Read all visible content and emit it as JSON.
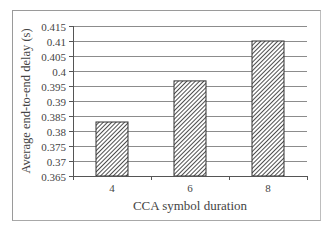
{
  "chart_data": {
    "type": "bar",
    "title": "",
    "xlabel": "CCA symbol duration",
    "ylabel": "Average end-to-end delay (s)",
    "categories": [
      "4",
      "6",
      "8"
    ],
    "values": [
      0.383,
      0.3967,
      0.41
    ],
    "ylim": [
      0.365,
      0.415
    ],
    "yticks": [
      "0.415",
      "0.41",
      "0.405",
      "0.4",
      "0.395",
      "0.39",
      "0.385",
      "0.38",
      "0.375",
      "0.37",
      "0.365"
    ],
    "grid": true,
    "legend": null,
    "bar_fill": "diagonal hatch (dark gray)",
    "colors": {
      "bar_hatch": "#3a3a3a",
      "gridline": "#8c8c8c",
      "axis": "#555555",
      "frame": "#9a9a9a"
    }
  }
}
